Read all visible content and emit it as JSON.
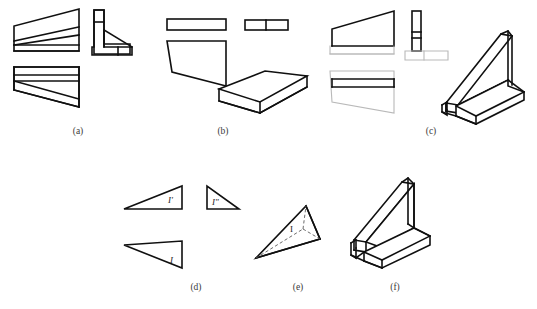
{
  "figure": {
    "background_color": "#ffffff",
    "line_color": "#101010",
    "faint_line_color": "#b9b9b9",
    "hidden_line_color": "#5a5a5a"
  },
  "captions": {
    "a": "(a)",
    "b": "(b)",
    "c": "(c)",
    "d": "(d)",
    "e": "(e)",
    "f": "(f)"
  },
  "labels": {
    "d_front": "I'",
    "d_side": "I\"",
    "d_top": "I",
    "e_point": "I"
  },
  "groups": [
    {
      "id": "a",
      "caption": "(a)",
      "views": [
        "front-view",
        "side-view",
        "top-view"
      ],
      "description": "Front view wedge with inclined rib, T-shaped side view, top view with tapered rib"
    },
    {
      "id": "b",
      "caption": "(b)",
      "views": [
        "top-view",
        "side-view",
        "front-view",
        "isometric-view"
      ],
      "description": "Thin bar top view, two-cell side view, trapezoid front view, isometric wedge slab"
    },
    {
      "id": "c",
      "caption": "(c)",
      "views": [
        "front-view",
        "side-view",
        "top-view",
        "isometric-view"
      ],
      "description": "Wedge front view, vertical rib side view, top view, isometric rib bracket on T-base"
    },
    {
      "id": "d",
      "caption": "(d)",
      "views": [
        "front-view",
        "side-view",
        "top-view"
      ],
      "description": "Three triangular projections labelled I prime, I double prime and I"
    },
    {
      "id": "e",
      "caption": "(e)",
      "views": [
        "isometric-view"
      ],
      "description": "Tetrahedron with hidden edges and vertex I"
    },
    {
      "id": "f",
      "caption": "(f)",
      "views": [
        "isometric-view"
      ],
      "description": "Isometric triangular rib bracket mounted on slotted base"
    }
  ]
}
